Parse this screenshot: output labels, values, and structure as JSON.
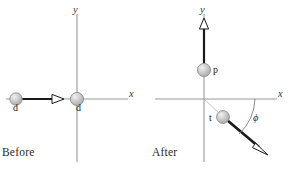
{
  "figure": {
    "type": "physics-collision-diagram",
    "reaction": "d + d -> p + t",
    "colors": {
      "axis": "#9a9a9a",
      "vector": "#1a1a1a",
      "sphere_fill": "#c9c9c9",
      "sphere_edge": "#8f8f8f",
      "arc": "#7d7d7d",
      "text": "#1d1d1d",
      "background": "#ffffff"
    }
  },
  "panels": [
    {
      "id": "before",
      "caption": "Before",
      "axis_x_label": "x",
      "axis_y_label": "y",
      "particles": [
        {
          "id": "incoming-d",
          "label": "d",
          "x": -62,
          "y": 0,
          "moving": true
        },
        {
          "id": "target-d",
          "label": "d",
          "x": 0,
          "y": 0,
          "moving": false
        }
      ],
      "vectors": [
        {
          "id": "incoming-d-velocity",
          "from": [
            -54,
            0
          ],
          "to": [
            -18,
            0
          ],
          "direction": "right",
          "angle_deg": 0
        }
      ],
      "angles": []
    },
    {
      "id": "after",
      "caption": "After",
      "axis_x_label": "x",
      "axis_y_label": "y",
      "particles": [
        {
          "id": "proton-p",
          "label": "p",
          "x": 0,
          "y": 55,
          "moving": true
        },
        {
          "id": "triton-t",
          "label": "t",
          "x": 30,
          "y": -33,
          "moving": true
        }
      ],
      "vectors": [
        {
          "id": "proton-velocity",
          "from": [
            0,
            63
          ],
          "to": [
            0,
            104
          ],
          "direction": "up",
          "angle_deg": 90
        },
        {
          "id": "triton-velocity",
          "from": [
            37,
            -40
          ],
          "to": [
            83,
            -85
          ],
          "direction": "down-right",
          "angle_deg": -45
        }
      ],
      "angles": [
        {
          "id": "phi-angle",
          "symbol": "ϕ",
          "between": [
            "+x axis",
            "triton-velocity"
          ],
          "measured": "below +x axis"
        }
      ]
    }
  ]
}
